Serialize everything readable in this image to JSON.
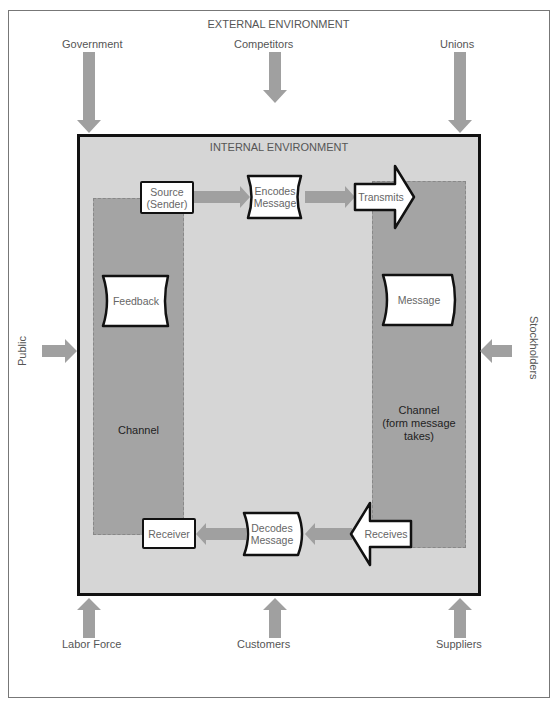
{
  "diagram": {
    "external_title": "EXTERNAL ENVIRONMENT",
    "internal_title": "INTERNAL ENVIRONMENT",
    "external_factors": {
      "top": [
        "Government",
        "Competitors",
        "Unions"
      ],
      "left": "Public",
      "right": "Stockholders",
      "bottom": [
        "Labor Force",
        "Customers",
        "Suppliers"
      ]
    },
    "process": {
      "source": "Source (Sender)",
      "source_lines": [
        "Source",
        "(Sender)"
      ],
      "encodes_lines": [
        "Encodes",
        "Message"
      ],
      "transmits": "Transmits",
      "message": "Message",
      "receives": "Receives",
      "decodes_lines": [
        "Decodes",
        "Message"
      ],
      "receiver": "Receiver",
      "feedback": "Feedback"
    },
    "channels": {
      "left": "Channel",
      "right_lines": [
        "Channel",
        "(form message",
        "takes)"
      ]
    },
    "colors": {
      "arrow": "#a0a0a0",
      "internal_bg": "#d6d6d6",
      "channel_bg": "#a4a4a4",
      "border": "#111111"
    }
  }
}
